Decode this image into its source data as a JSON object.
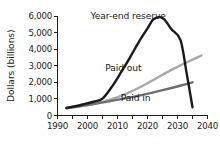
{
  "chart_data": {
    "type": "line",
    "title": "",
    "xlabel": "",
    "ylabel": "Dollars (billions)",
    "xlim": [
      1990,
      2040
    ],
    "ylim": [
      0,
      6000
    ],
    "grid": false,
    "legend_position": "inline-annotations",
    "x_ticks": [
      1990,
      2000,
      2010,
      2020,
      2030,
      2040
    ],
    "x_tick_labels": [
      "1990",
      "2000",
      "2010",
      "2020",
      "2030",
      "2040"
    ],
    "x_minor_ticks": [
      1995,
      2005,
      2015,
      2025,
      2035
    ],
    "y_ticks": [
      0,
      1000,
      2000,
      3000,
      4000,
      5000,
      6000
    ],
    "y_tick_labels": [
      "0",
      "1,000",
      "2,000",
      "3,000",
      "4,000",
      "5,000",
      "6,000"
    ],
    "series": [
      {
        "name": "Year-end reserve",
        "color": "#1a1a1a",
        "width": 2.4,
        "label_x": 2001,
        "label_y": 5790,
        "x": [
          1993,
          1996,
          1999,
          2002,
          2005,
          2008,
          2011,
          2014,
          2017,
          2020,
          2022,
          2025,
          2028,
          2031,
          2033,
          2035
        ],
        "y": [
          450,
          560,
          690,
          830,
          1020,
          1700,
          2550,
          3450,
          4400,
          5250,
          5800,
          5880,
          5200,
          4550,
          2600,
          500
        ]
      },
      {
        "name": "Paid out",
        "color": "#a8a8a8",
        "width": 2.4,
        "label_x": 2018,
        "label_y": 2700,
        "x": [
          1993,
          1998,
          2003,
          2008,
          2013,
          2018,
          2023,
          2028,
          2033,
          2038
        ],
        "y": [
          420,
          560,
          740,
          980,
          1320,
          1750,
          2250,
          2750,
          3200,
          3620
        ]
      },
      {
        "name": "Paid in",
        "color": "#6e6e6e",
        "width": 2.4,
        "label_x": 2021,
        "label_y": 890,
        "x": [
          1993,
          1998,
          2003,
          2008,
          2013,
          2018,
          2023,
          2028,
          2032,
          2035
        ],
        "y": [
          470,
          590,
          720,
          880,
          1050,
          1230,
          1440,
          1660,
          1850,
          2000
        ]
      }
    ]
  }
}
